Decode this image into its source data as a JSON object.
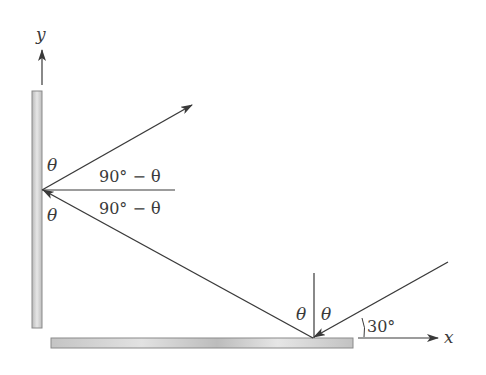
{
  "diagram": {
    "type": "mirror-reflection",
    "axes": {
      "y_label": "y",
      "x_label": "x"
    },
    "angles": {
      "theta_upper_left": "θ",
      "theta_lower_left": "θ",
      "complement_upper": "90° − θ",
      "complement_lower": "90° − θ",
      "theta_bottom_left": "θ",
      "theta_bottom_right": "θ",
      "incidence_angle": "30°"
    },
    "colors": {
      "line": "#3a3a3a",
      "mirror_fill": "#c8c8c8",
      "mirror_edge": "#8a8a8a"
    }
  }
}
